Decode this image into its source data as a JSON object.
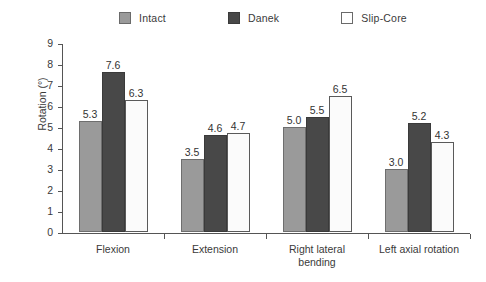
{
  "chart_data": {
    "type": "bar",
    "title": "",
    "xlabel": "",
    "ylabel": "Rotation (°)",
    "ylim": [
      0,
      9
    ],
    "ytick_labels": [
      "9",
      "8",
      "7",
      "6",
      "5",
      "4",
      "3",
      "2",
      "1",
      "0"
    ],
    "grid": false,
    "legend_position": "top-center",
    "categories": [
      "Flexion",
      "Extension",
      "Right lateral\nbending",
      "Left axial rotation"
    ],
    "series": [
      {
        "name": "Intact",
        "color": "#9a9a9a",
        "values": [
          5.3,
          3.5,
          5.0,
          3.0
        ],
        "labels": [
          "5.3",
          "3.5",
          "5.0",
          "3.0"
        ]
      },
      {
        "name": "Danek",
        "color": "#484848",
        "values": [
          7.6,
          4.6,
          5.5,
          5.2
        ],
        "labels": [
          "7.6",
          "4.6",
          "5.5",
          "5.2"
        ]
      },
      {
        "name": "Slip-Core",
        "color": "#fbfbfb",
        "values": [
          6.3,
          4.7,
          6.5,
          4.3
        ],
        "labels": [
          "6.3",
          "4.7",
          "6.5",
          "4.3"
        ]
      }
    ]
  },
  "legend": {
    "items": [
      {
        "label": "Intact",
        "swatch": "#9a9a9a"
      },
      {
        "label": "Danek",
        "swatch": "#484848"
      },
      {
        "label": "Slip-Core",
        "swatch": "#ffffff"
      }
    ]
  },
  "axes": {
    "y_title": "Rotation (°)",
    "y_ticks": [
      "9",
      "8",
      "7",
      "6",
      "5",
      "4",
      "3",
      "2",
      "1",
      "0"
    ],
    "x_categories": [
      "Flexion",
      "Extension",
      "Right lateral\nbending",
      "Left axial rotation"
    ]
  }
}
